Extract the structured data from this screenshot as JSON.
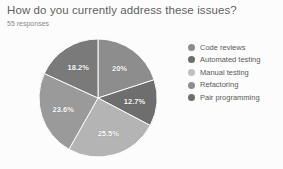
{
  "header": {
    "title": "How do you currently address these issues?",
    "responses": "55 responses"
  },
  "chart_data": {
    "type": "pie",
    "title": "How do you currently address these issues?",
    "subtitle": "55 responses",
    "total_responses": 55,
    "legend_position": "right",
    "categories": [
      "Code reviews",
      "Automated testing",
      "Manual testing",
      "Refactoring",
      "Pair programming"
    ],
    "values": [
      20,
      12.7,
      25.5,
      23.6,
      18.2
    ],
    "labels": [
      "20%",
      "12.7%",
      "25.5%",
      "23.6%",
      "18.2%"
    ],
    "colors": [
      "#8d8d8d",
      "#6e6e6e",
      "#b4b4b4",
      "#9a9a9a",
      "#7a7a7a"
    ],
    "slices": [
      {
        "label": "Code reviews",
        "value": 20,
        "display": "20%",
        "color": "#8d8d8d"
      },
      {
        "label": "Automated testing",
        "value": 12.7,
        "display": "12.7%",
        "color": "#6e6e6e"
      },
      {
        "label": "Manual testing",
        "value": 25.5,
        "display": "25.5%",
        "color": "#b4b4b4"
      },
      {
        "label": "Refactoring",
        "value": 23.6,
        "display": "23.6%",
        "color": "#9a9a9a"
      },
      {
        "label": "Pair programming",
        "value": 18.2,
        "display": "18.2%",
        "color": "#7a7a7a"
      }
    ]
  },
  "legend": {
    "items": [
      {
        "label": "Code reviews",
        "color": "#8d8d8d"
      },
      {
        "label": "Automated testing",
        "color": "#6e6e6e"
      },
      {
        "label": "Manual testing",
        "color": "#c0c0c0"
      },
      {
        "label": "Refactoring",
        "color": "#8d8d8d"
      },
      {
        "label": "Pair programming",
        "color": "#6e6e6e"
      }
    ]
  }
}
